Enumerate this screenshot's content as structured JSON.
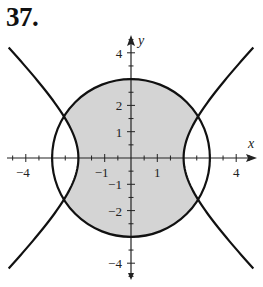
{
  "problem": {
    "number": "37."
  },
  "plot": {
    "origin_px": [
      131,
      158
    ],
    "unit_px": 26.3,
    "x_axis_label": "x",
    "y_axis_label": "y",
    "x_tick_labels": [
      {
        "value": -4,
        "text": "−4"
      },
      {
        "value": -1,
        "text": "−1"
      },
      {
        "value": 1,
        "text": "1"
      },
      {
        "value": 4,
        "text": "4"
      }
    ],
    "y_tick_labels": [
      {
        "value": 4,
        "text": "4"
      },
      {
        "value": 2,
        "text": "2"
      },
      {
        "value": 1,
        "text": "1"
      },
      {
        "value": -1,
        "text": "−1"
      },
      {
        "value": -2,
        "text": "−2"
      },
      {
        "value": -4,
        "text": "−4"
      }
    ],
    "colors": {
      "shade": "#d4d4d4",
      "curve": "#111111",
      "axis": "#222222"
    }
  },
  "chart_data": {
    "type": "region-plot",
    "title": "37.",
    "xlabel": "x",
    "ylabel": "y",
    "xlim": [
      -4.7,
      4.7
    ],
    "ylim": [
      -4.7,
      4.7
    ],
    "x_ticks_labeled": [
      -4,
      -1,
      1,
      4
    ],
    "y_ticks_labeled": [
      -4,
      -2,
      -1,
      1,
      2,
      4
    ],
    "minor_tick_step": 0.5,
    "curves": [
      {
        "name": "circle",
        "equation": "x^2 + y^2 = 9",
        "radius": 3
      },
      {
        "name": "hyperbola",
        "equation": "x^2 - y^2 = 4",
        "vertices": [
          [
            -2,
            0
          ],
          [
            2,
            0
          ]
        ],
        "y_range": [
          -4.2,
          4.2
        ]
      }
    ],
    "shaded_region": "x^2 + y^2 <= 9 and x^2 - y^2 <= 4",
    "intersections": [
      [
        2.55,
        1.58
      ],
      [
        -2.55,
        1.58
      ],
      [
        2.55,
        -1.58
      ],
      [
        -2.55,
        -1.58
      ]
    ],
    "grid": false
  }
}
